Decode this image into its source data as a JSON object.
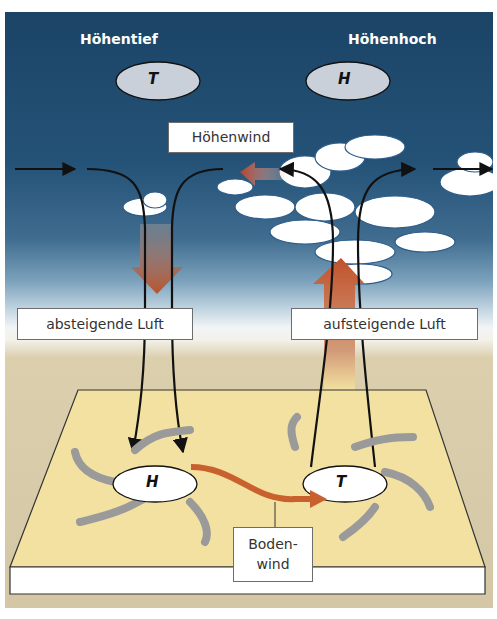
{
  "headers": {
    "left": "Höhentief",
    "right": "Höhenhoch"
  },
  "upper_pressure": {
    "left_symbol": "T",
    "right_symbol": "H"
  },
  "surface_pressure": {
    "left_symbol": "H",
    "right_symbol": "T"
  },
  "labels": {
    "upper_wind": "Höhenwind",
    "descending_air": "absteigende Luft",
    "ascending_air": "aufsteigende Luft",
    "surface_wind_line1": "Boden-",
    "surface_wind_line2": "wind"
  },
  "colors": {
    "sky_top": "#1b4466",
    "ground": "#d4c7a6",
    "plate": "#f2e1a0",
    "airflow_arrow": "#b8532d",
    "surface_wind_arrow": "#c9612e",
    "circulation_arrow": "#9a9a9a"
  }
}
